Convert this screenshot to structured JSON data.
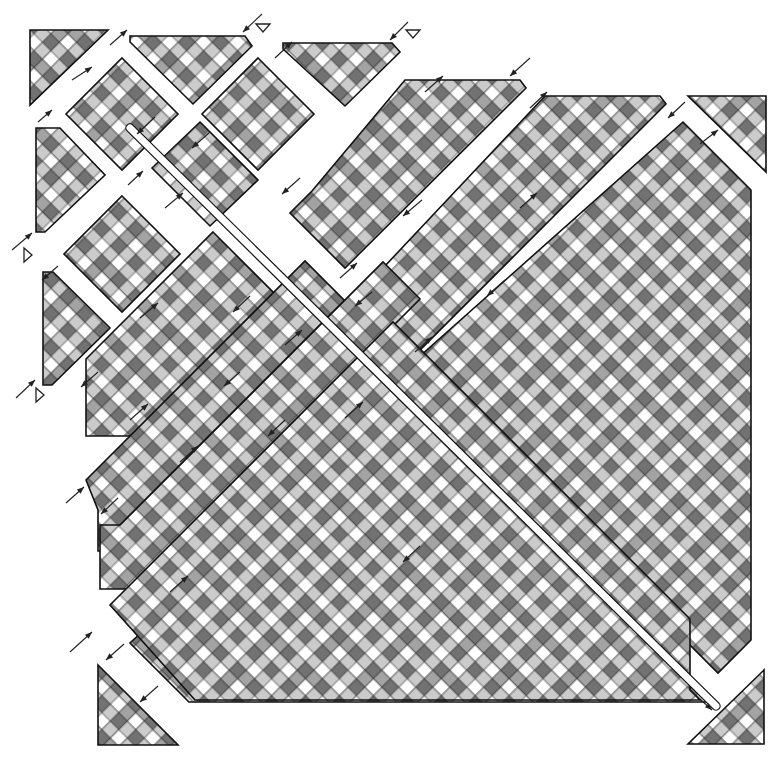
{
  "figure": {
    "title": "",
    "width": 774,
    "height": 765,
    "cell_size": 12,
    "cell_rotation_deg": 45,
    "palette": {
      "white": "#ffffff",
      "light": "#cbcbcb",
      "mid": "#a3a3a3",
      "dark": "#727272",
      "outline": "#111111",
      "background": "#ffffff"
    },
    "checker_pattern_4x4": [
      [
        "white",
        "light",
        "white",
        "light"
      ],
      [
        "light",
        "dark",
        "mid",
        "dark"
      ],
      [
        "white",
        "mid",
        "white",
        "light"
      ],
      [
        "light",
        "dark",
        "light",
        "dark"
      ]
    ],
    "pieces": [
      {
        "id": "corner-top-left-triangle",
        "points": "30,30 108,30 30,105",
        "shade": "light"
      },
      {
        "id": "top-strip-piece-1",
        "points": "130,36 245,36 252,46 193,104 130,42",
        "shade": "light"
      },
      {
        "id": "top-strip-piece-2",
        "points": "283,43 392,43 400,52 345,106 283,49",
        "shade": "light"
      },
      {
        "id": "diamond-block-1",
        "points": "122,58 178,114 122,170 66,114",
        "shade": "dark"
      },
      {
        "id": "diamond-block-2",
        "points": "258,58 314,114 258,170 202,114",
        "shade": "dark"
      },
      {
        "id": "left-wedge-1",
        "points": "36,128 60,128 105,175 45,232 36,232",
        "shade": "light"
      },
      {
        "id": "diamond-block-3",
        "points": "122,196 180,254 122,312 64,254",
        "shade": "dark"
      },
      {
        "id": "mid-block-left-1",
        "points": "152,168 200,122 258,180 210,226",
        "shade": "light"
      },
      {
        "id": "left-wedge-2",
        "points": "43,272 53,272 110,328 52,385 43,385",
        "shade": "light"
      },
      {
        "id": "upper-strip-long-1",
        "points": "405,80 520,80 526,88 345,268 290,213 312,191",
        "shade": "dark"
      },
      {
        "id": "upper-strip-long-2",
        "points": "545,96 660,96 666,104 394,376 336,318",
        "shade": "dark"
      },
      {
        "id": "strip-a-lower",
        "points": "213,232 290,309 163,436 86,436 86,359",
        "shade": "dark"
      },
      {
        "id": "strip-b",
        "points": "86,480 305,261 376,332 375,333 157,551 98,551 98,510",
        "shade": "dark"
      },
      {
        "id": "left-strip-lower",
        "points": "100,525 120,525 383,262 420,299 130,589 100,589",
        "shade": "dark"
      },
      {
        "id": "big-upper-right",
        "points": "683,122 751,190 751,640 718,673 410,365",
        "shade": "dark"
      },
      {
        "id": "big-lower",
        "points": "400,392 710,702 189,702 130,643",
        "shade": "dark"
      },
      {
        "id": "bottom-mid-band",
        "points": "110,605 393,322 690,619 690,690 700,700 195,700",
        "shade": "dark"
      },
      {
        "id": "corner-top-right-triangle",
        "points": "688,96 766,96 766,172",
        "shade": "light"
      },
      {
        "id": "corner-bottom-left-triangle",
        "points": "98,665 178,745 98,745",
        "shade": "light"
      },
      {
        "id": "corner-bottom-right-triangle",
        "points": "764,670 764,744 688,744",
        "shade": "light"
      }
    ],
    "channels": [
      {
        "id": "main-diagonal-channel",
        "from": [
          130,
          128
        ],
        "to": [
          716,
          706
        ],
        "width": 7
      }
    ],
    "arrows": [
      {
        "id": "arrow-1",
        "x1": 262,
        "y1": 14,
        "x2": 243,
        "y2": 32
      },
      {
        "id": "arrow-2",
        "x1": 110,
        "y1": 45,
        "x2": 127,
        "y2": 30
      },
      {
        "id": "arrow-3",
        "x1": 408,
        "y1": 22,
        "x2": 390,
        "y2": 40
      },
      {
        "id": "arrow-4",
        "x1": 530,
        "y1": 58,
        "x2": 510,
        "y2": 76
      },
      {
        "id": "arrow-5",
        "x1": 275,
        "y1": 58,
        "x2": 292,
        "y2": 42
      },
      {
        "id": "arrow-6",
        "x1": 72,
        "y1": 80,
        "x2": 92,
        "y2": 67
      },
      {
        "id": "arrow-7",
        "x1": 38,
        "y1": 122,
        "x2": 52,
        "y2": 110
      },
      {
        "id": "arrow-8",
        "x1": 155,
        "y1": 117,
        "x2": 137,
        "y2": 134
      },
      {
        "id": "arrow-9",
        "x1": 210,
        "y1": 132,
        "x2": 192,
        "y2": 148
      },
      {
        "id": "arrow-10",
        "x1": 425,
        "y1": 92,
        "x2": 443,
        "y2": 76
      },
      {
        "id": "arrow-11",
        "x1": 530,
        "y1": 108,
        "x2": 547,
        "y2": 92
      },
      {
        "id": "arrow-12",
        "x1": 685,
        "y1": 102,
        "x2": 668,
        "y2": 118
      },
      {
        "id": "arrow-13",
        "x1": 700,
        "y1": 144,
        "x2": 718,
        "y2": 130
      },
      {
        "id": "arrow-14",
        "x1": 12,
        "y1": 250,
        "x2": 32,
        "y2": 233
      },
      {
        "id": "arrow-15",
        "x1": 128,
        "y1": 185,
        "x2": 143,
        "y2": 171
      },
      {
        "id": "arrow-16",
        "x1": 58,
        "y1": 266,
        "x2": 42,
        "y2": 280
      },
      {
        "id": "arrow-17",
        "x1": 165,
        "y1": 208,
        "x2": 183,
        "y2": 193
      },
      {
        "id": "arrow-18",
        "x1": 300,
        "y1": 178,
        "x2": 282,
        "y2": 194
      },
      {
        "id": "arrow-19",
        "x1": 422,
        "y1": 200,
        "x2": 403,
        "y2": 216
      },
      {
        "id": "arrow-20",
        "x1": 520,
        "y1": 208,
        "x2": 537,
        "y2": 193
      },
      {
        "id": "arrow-21",
        "x1": 140,
        "y1": 318,
        "x2": 158,
        "y2": 303
      },
      {
        "id": "arrow-22",
        "x1": 250,
        "y1": 296,
        "x2": 233,
        "y2": 312
      },
      {
        "id": "arrow-23",
        "x1": 340,
        "y1": 278,
        "x2": 357,
        "y2": 263
      },
      {
        "id": "arrow-24",
        "x1": 372,
        "y1": 292,
        "x2": 355,
        "y2": 306
      },
      {
        "id": "arrow-25",
        "x1": 505,
        "y1": 280,
        "x2": 487,
        "y2": 296
      },
      {
        "id": "arrow-26",
        "x1": 16,
        "y1": 398,
        "x2": 35,
        "y2": 380
      },
      {
        "id": "arrow-27",
        "x1": 98,
        "y1": 372,
        "x2": 81,
        "y2": 387
      },
      {
        "id": "arrow-28",
        "x1": 285,
        "y1": 345,
        "x2": 302,
        "y2": 330
      },
      {
        "id": "arrow-29",
        "x1": 415,
        "y1": 352,
        "x2": 432,
        "y2": 337
      },
      {
        "id": "arrow-30",
        "x1": 240,
        "y1": 372,
        "x2": 224,
        "y2": 386
      },
      {
        "id": "arrow-31",
        "x1": 130,
        "y1": 420,
        "x2": 148,
        "y2": 404
      },
      {
        "id": "arrow-32",
        "x1": 285,
        "y1": 420,
        "x2": 268,
        "y2": 436
      },
      {
        "id": "arrow-33",
        "x1": 66,
        "y1": 503,
        "x2": 84,
        "y2": 487
      },
      {
        "id": "arrow-34",
        "x1": 118,
        "y1": 498,
        "x2": 101,
        "y2": 514
      },
      {
        "id": "arrow-35",
        "x1": 180,
        "y1": 462,
        "x2": 198,
        "y2": 446
      },
      {
        "id": "arrow-36",
        "x1": 345,
        "y1": 418,
        "x2": 363,
        "y2": 402
      },
      {
        "id": "arrow-37",
        "x1": 70,
        "y1": 652,
        "x2": 92,
        "y2": 632
      },
      {
        "id": "arrow-38",
        "x1": 124,
        "y1": 644,
        "x2": 106,
        "y2": 660
      },
      {
        "id": "arrow-39",
        "x1": 170,
        "y1": 592,
        "x2": 188,
        "y2": 576
      },
      {
        "id": "arrow-40",
        "x1": 158,
        "y1": 686,
        "x2": 140,
        "y2": 702
      },
      {
        "id": "arrow-41",
        "x1": 420,
        "y1": 546,
        "x2": 403,
        "y2": 562
      },
      {
        "id": "arrow-42",
        "x1": 690,
        "y1": 690,
        "x2": 712,
        "y2": 710
      }
    ],
    "markers": [
      {
        "id": "marker-top-1",
        "points": "256,24 270,24 263,32",
        "direction": "down"
      },
      {
        "id": "marker-top-2",
        "points": "406,30 420,30 413,38",
        "direction": "down"
      },
      {
        "id": "marker-left-1",
        "points": "24,248 24,262 32,255",
        "direction": "right"
      },
      {
        "id": "marker-left-2",
        "points": "36,388 36,402 44,395",
        "direction": "right"
      }
    ]
  }
}
